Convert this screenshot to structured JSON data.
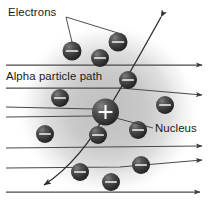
{
  "figure": {
    "background_color": "#ffffff",
    "glow_color": "#c9c9c9",
    "electron_color": "#3c3c3c",
    "nucleus_color": "#3a3a3a",
    "ray_color": "#4a4a4a",
    "text_color": "#1a1a1a"
  },
  "labels": {
    "electrons": "Electrons",
    "alpha_particle_path": "Alpha particle path",
    "nucleus": "Nucleus"
  },
  "nucleus": {
    "symbol": "+",
    "cx": 105.5,
    "cy": 112,
    "r": 13.5
  },
  "electrons": [
    {
      "cx": 72,
      "cy": 51,
      "r": 9.5
    },
    {
      "cx": 118,
      "cy": 42,
      "r": 9.5
    },
    {
      "cx": 100,
      "cy": 58,
      "r": 9.0
    },
    {
      "cx": 128,
      "cy": 80,
      "r": 9.0
    },
    {
      "cx": 60,
      "cy": 98,
      "r": 9.0
    },
    {
      "cx": 165,
      "cy": 105,
      "r": 9.0
    },
    {
      "cx": 45,
      "cy": 134,
      "r": 9.0
    },
    {
      "cx": 98,
      "cy": 135,
      "r": 9.0
    },
    {
      "cx": 138,
      "cy": 130,
      "r": 9.0
    },
    {
      "cx": 141,
      "cy": 165,
      "r": 9.0
    },
    {
      "cx": 80,
      "cy": 172,
      "r": 9.0
    },
    {
      "cx": 111,
      "cy": 182,
      "r": 9.0
    }
  ],
  "rays": [
    {
      "name": "ray-1",
      "y": 65,
      "arrow": true,
      "deflected": false
    },
    {
      "name": "ray-2",
      "y": 88,
      "arrow": true,
      "deflected": true
    },
    {
      "name": "ray-3",
      "y": 107,
      "arrow": false,
      "deflected": false
    },
    {
      "name": "ray-4",
      "y": 117,
      "arrow": false,
      "deflected": false
    },
    {
      "name": "ray-5",
      "y": 148,
      "arrow": true,
      "deflected": false
    },
    {
      "name": "ray-6",
      "y": 168,
      "arrow": true,
      "deflected": true
    },
    {
      "name": "ray-7",
      "y": 192,
      "arrow": true,
      "deflected": false
    }
  ],
  "alpha_path": {
    "start_x": 39,
    "start_y": 188,
    "end_x": 161,
    "end_y": 17,
    "arrow_top": true,
    "arrow_bottom": true
  },
  "glow": {
    "cx": 108,
    "cy": 110,
    "rx": 92,
    "ry": 88
  }
}
